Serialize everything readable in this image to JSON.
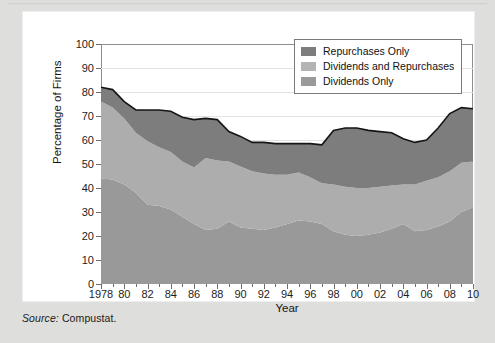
{
  "figure": {
    "source_label": "Source:",
    "source_text": " Compustat."
  },
  "chart_data": {
    "type": "area",
    "stacked": true,
    "title": "",
    "xlabel": "Year",
    "ylabel": "Percentage of Firms",
    "ylim": [
      0,
      100
    ],
    "xlim": [
      1978,
      2010
    ],
    "ytick_labels": [
      "0",
      "10",
      "20",
      "30",
      "40",
      "50",
      "60",
      "70",
      "80",
      "90",
      "100"
    ],
    "ytick_values": [
      0,
      10,
      20,
      30,
      40,
      50,
      60,
      70,
      80,
      90,
      100
    ],
    "xtick_labels": [
      "1978",
      "80",
      "82",
      "84",
      "86",
      "88",
      "90",
      "92",
      "94",
      "96",
      "98",
      "00",
      "02",
      "04",
      "06",
      "08",
      "10"
    ],
    "xtick_values": [
      1978,
      1980,
      1982,
      1984,
      1986,
      1988,
      1990,
      1992,
      1994,
      1996,
      1998,
      2000,
      2002,
      2004,
      2006,
      2008,
      2010
    ],
    "grid": "horizontal",
    "legend_position": "top-right",
    "x": [
      1978,
      1979,
      1980,
      1981,
      1982,
      1983,
      1984,
      1985,
      1986,
      1987,
      1988,
      1989,
      1990,
      1991,
      1992,
      1993,
      1994,
      1995,
      1996,
      1997,
      1998,
      1999,
      2000,
      2001,
      2002,
      2003,
      2004,
      2005,
      2006,
      2007,
      2008,
      2009,
      2010
    ],
    "series": [
      {
        "name": "Dividends Only",
        "color": "#999999",
        "values": [
          44.0,
          43.5,
          41.5,
          38.0,
          33.0,
          32.5,
          31.0,
          28.0,
          25.0,
          22.5,
          23.0,
          26.0,
          23.5,
          23.0,
          22.5,
          23.5,
          25.0,
          26.5,
          26.0,
          25.0,
          22.0,
          20.5,
          20.0,
          20.5,
          21.5,
          23.0,
          25.0,
          22.0,
          22.5,
          24.0,
          26.0,
          30.0,
          32.0
        ]
      },
      {
        "name": "Dividends and Repurchases",
        "color": "#adadad",
        "values": [
          32.0,
          30.0,
          27.5,
          25.0,
          26.5,
          24.5,
          24.0,
          23.0,
          23.5,
          30.0,
          28.5,
          25.0,
          25.5,
          24.0,
          23.5,
          22.0,
          20.5,
          20.0,
          18.5,
          17.0,
          19.5,
          20.0,
          20.0,
          19.5,
          19.0,
          18.0,
          16.5,
          19.5,
          20.5,
          20.5,
          21.0,
          20.5,
          19.0
        ]
      },
      {
        "name": "Repurchases Only",
        "color": "#7d7d7d",
        "values": [
          6.0,
          7.5,
          7.0,
          9.5,
          13.0,
          15.5,
          17.0,
          18.5,
          20.0,
          16.5,
          17.0,
          12.5,
          12.5,
          12.0,
          13.0,
          13.0,
          13.0,
          12.0,
          14.0,
          16.0,
          22.5,
          24.5,
          25.0,
          24.0,
          23.0,
          22.0,
          19.0,
          17.5,
          17.0,
          20.5,
          24.0,
          23.0,
          22.0
        ]
      }
    ],
    "cumulative_totals": [
      82.0,
      81.0,
      76.0,
      72.5,
      72.5,
      72.5,
      72.0,
      69.5,
      68.5,
      69.0,
      68.5,
      63.5,
      61.5,
      59.0,
      59.0,
      58.5,
      58.5,
      58.5,
      58.5,
      58.0,
      64.0,
      65.0,
      65.0,
      64.0,
      63.5,
      63.0,
      60.5,
      59.0,
      60.0,
      65.0,
      71.0,
      73.5,
      73.0
    ]
  },
  "legend": {
    "items": [
      {
        "label": "Repurchases Only",
        "color": "#7d7d7d"
      },
      {
        "label": "Dividends and Repurchases",
        "color": "#b4b4b4"
      },
      {
        "label": "Dividends Only",
        "color": "#9a9a9a"
      }
    ]
  }
}
